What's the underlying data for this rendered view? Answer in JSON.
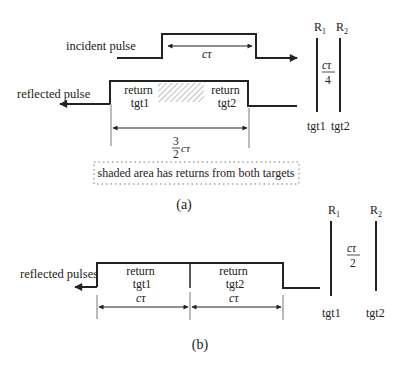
{
  "panel_a": {
    "caption": "(a)",
    "incident_label": "incident pulse",
    "incident_width_label": "cτ",
    "reflected_label": "reflected pulse",
    "return_tgt1_line1": "return",
    "return_tgt1_line2": "tgt1",
    "return_tgt2_line1": "return",
    "return_tgt2_line2": "tgt2",
    "reflected_width_numerator": "3",
    "reflected_width_denominator": "2",
    "reflected_width_suffix": "cτ",
    "note": "shaded area has returns from both targets",
    "range_1_label": "R",
    "range_1_sub": "1",
    "range_2_label": "R",
    "range_2_sub": "2",
    "separation_numerator": "cτ",
    "separation_denominator": "4",
    "target_1_label": "tgt1",
    "target_2_label": "tgt2"
  },
  "panel_b": {
    "caption": "(b)",
    "reflected_label": "reflected pulses",
    "return_tgt1_line1": "return",
    "return_tgt1_line2": "tgt1",
    "return_tgt2_line1": "return",
    "return_tgt2_line2": "tgt2",
    "width_1_label": "cτ",
    "width_2_label": "cτ",
    "range_1_label": "R",
    "range_1_sub": "1",
    "range_2_label": "R",
    "range_2_sub": "2",
    "separation_numerator": "cτ",
    "separation_denominator": "2",
    "target_1_label": "tgt1",
    "target_2_label": "tgt2"
  },
  "colors": {
    "line": "#222222",
    "hatch": "#8a8a8a",
    "background": "#ffffff"
  }
}
